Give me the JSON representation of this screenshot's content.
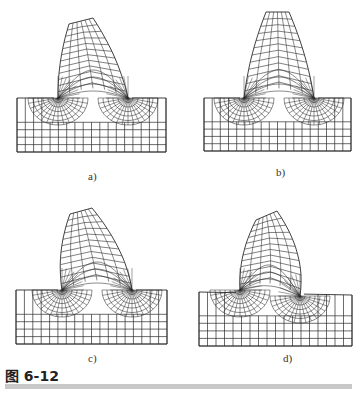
{
  "figure": {
    "caption": "图 6-12",
    "panels": [
      {
        "id": "a",
        "label": "a)",
        "label_pos": [
          88,
          170
        ],
        "base": {
          "x0": 17,
          "x1": 166,
          "y0": 98,
          "y1": 152,
          "left_top": 98,
          "right_top": 98
        },
        "tooth": {
          "root_left": [
            58,
            98
          ],
          "root_right": [
            128,
            98
          ],
          "tip_left": [
            69,
            24
          ],
          "tip_right": [
            93,
            18
          ],
          "lean": 8
        },
        "cols": 18,
        "rows": 5
      },
      {
        "id": "b",
        "label": "b)",
        "label_pos": [
          276,
          166
        ],
        "base": {
          "x0": 204,
          "x1": 351,
          "y0": 98,
          "y1": 151,
          "left_top": 98,
          "right_top": 98
        },
        "tooth": {
          "root_left": [
            244,
            98
          ],
          "root_right": [
            314,
            98
          ],
          "tip_left": [
            266,
            12
          ],
          "tip_right": [
            289,
            12
          ],
          "lean": 0
        },
        "cols": 18,
        "rows": 5
      },
      {
        "id": "c",
        "label": "c)",
        "label_pos": [
          88,
          352
        ],
        "base": {
          "x0": 16,
          "x1": 167,
          "y0": 290,
          "y1": 344,
          "left_top": 290,
          "right_top": 290
        },
        "tooth": {
          "root_left": [
            62,
            290
          ],
          "root_right": [
            132,
            290
          ],
          "tip_left": [
            70,
            214
          ],
          "tip_right": [
            92,
            208
          ],
          "lean": 22
        },
        "cols": 18,
        "rows": 5
      },
      {
        "id": "d",
        "label": "d)",
        "label_pos": [
          283,
          352
        ],
        "base": {
          "x0": 199,
          "x1": 352,
          "y0": 291,
          "y1": 346,
          "left_top": 292,
          "right_top": 295
        },
        "tooth": {
          "root_left": [
            240,
            290
          ],
          "root_right": [
            300,
            296
          ],
          "tip_left": [
            256,
            220
          ],
          "tip_right": [
            277,
            211
          ],
          "lean": 34
        },
        "cols": 18,
        "rows": 5
      }
    ]
  },
  "colors": {
    "mesh_line": "#2b2b2b",
    "background": "#ffffff",
    "rule": "#c8c8c8"
  }
}
